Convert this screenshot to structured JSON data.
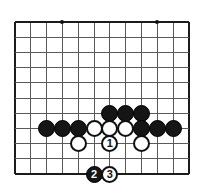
{
  "diagram": {
    "board": {
      "cols": 12,
      "rows": 11,
      "origin_x": 15,
      "origin_y": 22,
      "step_x": 15.8,
      "step_y": 15.2,
      "line_color": "#5a5a5a",
      "edge_color": "#1c1c1c",
      "background": "#ffffff"
    },
    "star_points": [
      {
        "name": "star-point-top-left",
        "col": 3,
        "row": 0
      },
      {
        "name": "star-point-top-right",
        "col": 9,
        "row": 0
      },
      {
        "name": "star-point-bottom-left",
        "col": 3,
        "row": 7
      },
      {
        "name": "star-point-bottom-right",
        "col": 9,
        "row": 7
      }
    ],
    "stones": [
      {
        "name": "black-stone-d4",
        "color": "black",
        "col": 6,
        "row": 6,
        "label": ""
      },
      {
        "name": "black-stone-e4",
        "color": "black",
        "col": 7,
        "row": 6,
        "label": ""
      },
      {
        "name": "black-stone-f4",
        "color": "black",
        "col": 8,
        "row": 6,
        "label": ""
      },
      {
        "name": "black-stone-b3",
        "color": "black",
        "col": 2,
        "row": 7,
        "label": ""
      },
      {
        "name": "black-stone-c3",
        "color": "black",
        "col": 3,
        "row": 7,
        "label": ""
      },
      {
        "name": "black-stone-d3",
        "color": "black",
        "col": 4,
        "row": 7,
        "label": ""
      },
      {
        "name": "white-stone-e3",
        "color": "white",
        "col": 5,
        "row": 7,
        "label": ""
      },
      {
        "name": "white-stone-f3",
        "color": "white",
        "col": 6,
        "row": 7,
        "label": ""
      },
      {
        "name": "white-stone-g3",
        "color": "white",
        "col": 7,
        "row": 7,
        "label": ""
      },
      {
        "name": "black-stone-h3",
        "color": "black",
        "col": 8,
        "row": 7,
        "label": ""
      },
      {
        "name": "black-stone-i3",
        "color": "black",
        "col": 9,
        "row": 7,
        "label": ""
      },
      {
        "name": "black-stone-j3",
        "color": "black",
        "col": 10,
        "row": 7,
        "label": ""
      },
      {
        "name": "white-stone-d2",
        "color": "white",
        "col": 4,
        "row": 8,
        "label": ""
      },
      {
        "name": "white-stone-move-1",
        "color": "white",
        "col": 6,
        "row": 8,
        "label": "1"
      },
      {
        "name": "white-stone-h2",
        "color": "white",
        "col": 8,
        "row": 8,
        "label": ""
      },
      {
        "name": "black-stone-move-2",
        "color": "black",
        "col": 5,
        "row": 10,
        "label": "2"
      },
      {
        "name": "white-stone-move-3",
        "color": "white",
        "col": 6,
        "row": 10,
        "label": "3"
      }
    ],
    "stone_diameter": 17,
    "move_labels": [
      "1",
      "2",
      "3"
    ]
  }
}
